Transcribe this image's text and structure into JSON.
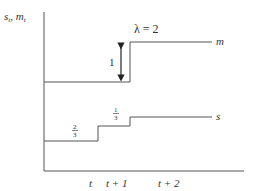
{
  "diagram": {
    "type": "step-function-diagram",
    "y_axis_label": "s_t, m_t",
    "y_axis_label_parts": {
      "s": "s",
      "s_sub": "t",
      "sep": ", ",
      "m": "m",
      "m_sub": "t"
    },
    "x_tick_labels": [
      "t",
      "t + 1",
      "t + 2"
    ],
    "parameter_label": "λ = 2",
    "jump_label": "1",
    "series": [
      {
        "name": "m",
        "label": "m",
        "steps": [
          {
            "from": "start",
            "to": "t+1",
            "level": "low"
          },
          {
            "from": "t+1",
            "to": "end",
            "level": "high",
            "jump": "1"
          }
        ]
      },
      {
        "name": "s",
        "label": "s",
        "steps": [
          {
            "from": "start",
            "to": "t",
            "level": "low",
            "annotation": "2/3"
          },
          {
            "from": "t",
            "to": "t+1",
            "level": "mid",
            "annotation": "1/3"
          },
          {
            "from": "t+1",
            "to": "end",
            "level": "high"
          }
        ]
      }
    ],
    "fractions": {
      "two_thirds": {
        "num": "2",
        "den": "3"
      },
      "one_third": {
        "num": "1",
        "den": "3"
      }
    },
    "colors": {
      "line": "#555555",
      "text": "#333333",
      "background": "#ffffff"
    }
  }
}
